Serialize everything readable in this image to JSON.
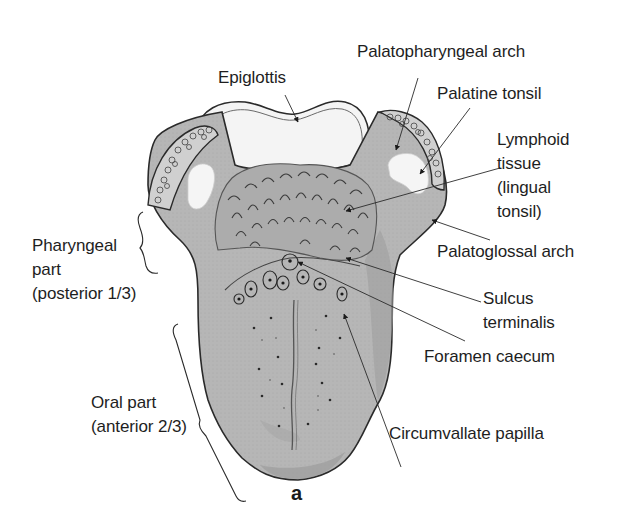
{
  "figure": {
    "panel_letter": "a"
  },
  "labels": {
    "epiglottis": "Epiglottis",
    "palatopharyngeal_arch": "Palatopharyngeal arch",
    "palatine_tonsil": "Palatine tonsil",
    "lymphoid_tissue": "Lymphoid\ntissue\n(lingual\ntonsil)",
    "palatoglossal_arch": "Palatoglossal arch",
    "sulcus_terminalis": "Sulcus\nterminalis",
    "foramen_caecum": "Foramen caecum",
    "circumvallate_papilla": "Circumvallate papilla",
    "pharyngeal_part": "Pharyngeal\npart\n(posterior 1/3)",
    "oral_part": "Oral part\n(anterior 2/3)"
  },
  "colors": {
    "tongue_fill": "#b4b4b4",
    "tongue_shadow": "#9c9c9c",
    "arch_fill": "#a8a8a8",
    "outline": "#2a2a2a",
    "epiglottis_fill": "#f4f4f4",
    "text": "#1e1e1e",
    "background": "#ffffff"
  }
}
